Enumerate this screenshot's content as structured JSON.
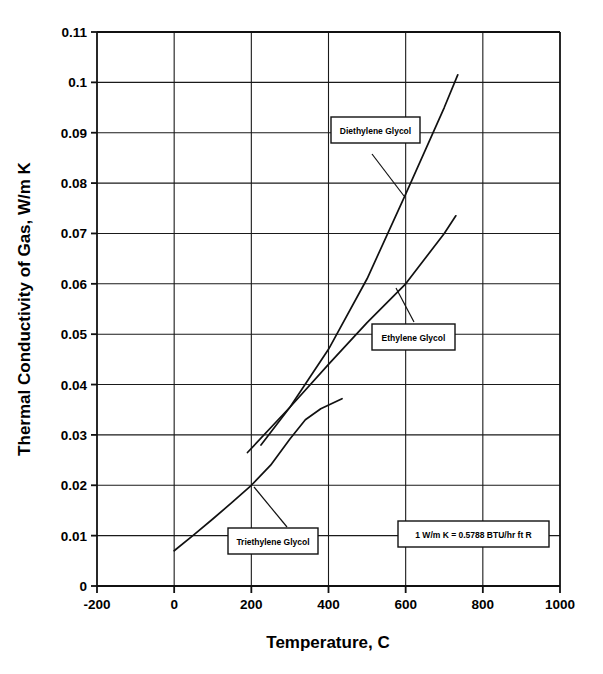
{
  "chart_data": {
    "type": "line",
    "title": "",
    "xlabel": "Temperature, C",
    "ylabel": "Thermal Conductivity of Gas, W/m K",
    "xlim": [
      -200,
      1000
    ],
    "ylim": [
      0,
      0.11
    ],
    "xticks": [
      "-200",
      "0",
      "200",
      "400",
      "600",
      "800",
      "1000"
    ],
    "xtick_values": [
      -200,
      0,
      200,
      400,
      600,
      800,
      1000
    ],
    "yticks": [
      "0",
      "0.01",
      "0.02",
      "0.03",
      "0.04",
      "0.05",
      "0.06",
      "0.07",
      "0.08",
      "0.09",
      "0.1",
      "0.11"
    ],
    "ytick_values": [
      0,
      0.01,
      0.02,
      0.03,
      0.04,
      0.05,
      0.06,
      0.07,
      0.08,
      0.09,
      0.1,
      0.11
    ],
    "grid": true,
    "legend_position": "inline-annotations",
    "series": [
      {
        "name": "Triethylene Glycol",
        "x": [
          0,
          50,
          100,
          150,
          200,
          250,
          300,
          340,
          380,
          435
        ],
        "values": [
          0.007,
          0.0101,
          0.0133,
          0.0166,
          0.02,
          0.024,
          0.0292,
          0.033,
          0.0352,
          0.0372
        ]
      },
      {
        "name": "Ethylene Glycol",
        "x": [
          190,
          300,
          400,
          500,
          600,
          700,
          730
        ],
        "values": [
          0.0265,
          0.0355,
          0.044,
          0.0523,
          0.06,
          0.07,
          0.0735
        ]
      },
      {
        "name": "Diethylene Glycol",
        "x": [
          225,
          300,
          400,
          500,
          600,
          700,
          735
        ],
        "values": [
          0.028,
          0.0355,
          0.047,
          0.061,
          0.0778,
          0.095,
          0.1015
        ]
      }
    ]
  },
  "annotations": [
    {
      "id": "diethylene",
      "label": "Diethylene Glycol"
    },
    {
      "id": "ethylene",
      "label": "Ethylene Glycol"
    },
    {
      "id": "triethylene",
      "label": "Triethylene Glycol"
    }
  ],
  "note": {
    "text": "1 W/m K = 0.5788 BTU/hr ft R"
  },
  "colors": {
    "line": "#111111",
    "grid": "#1a1a1a",
    "background": "#ffffff",
    "text": "#000000"
  }
}
